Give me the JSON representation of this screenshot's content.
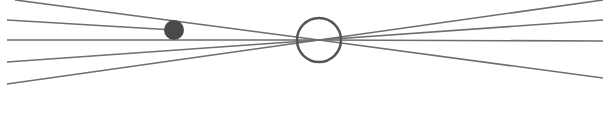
{
  "diagram": {
    "width": 613,
    "height": 121,
    "background": "#ffffff",
    "line_color": "#6e6e6e",
    "line_width": 1.6,
    "focal_point": {
      "cx": 319,
      "cy": 40,
      "r": 22,
      "stroke": "#555555",
      "stroke_width": 2.5
    },
    "dot": {
      "cx": 174,
      "cy": 30,
      "r": 10,
      "fill": "#4a4a4a"
    },
    "lines": [
      {
        "x1": 15,
        "y1": 0,
        "x2": 319,
        "y2": 40
      },
      {
        "x1": 7,
        "y1": 20,
        "x2": 174,
        "y2": 30
      },
      {
        "x1": 7,
        "y1": 40,
        "x2": 319,
        "y2": 40
      },
      {
        "x1": 7,
        "y1": 62,
        "x2": 319,
        "y2": 40
      },
      {
        "x1": 7,
        "y1": 84,
        "x2": 319,
        "y2": 40
      },
      {
        "x1": 319,
        "y1": 40,
        "x2": 603,
        "y2": 0
      },
      {
        "x1": 319,
        "y1": 40,
        "x2": 603,
        "y2": 20
      },
      {
        "x1": 319,
        "y1": 40,
        "x2": 603,
        "y2": 41
      },
      {
        "x1": 319,
        "y1": 40,
        "x2": 603,
        "y2": 78
      }
    ]
  }
}
